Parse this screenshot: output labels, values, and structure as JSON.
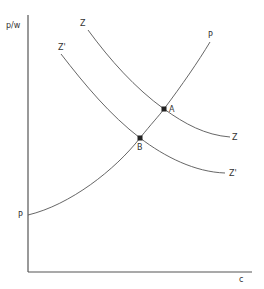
{
  "diagram": {
    "axes": {
      "y_label": "p/w",
      "x_label": "c"
    },
    "curves": [
      {
        "id": "P",
        "label": "P",
        "label_start": "P",
        "description": "upward-sloping curve from y-axis through B and A"
      },
      {
        "id": "Z",
        "label": "Z",
        "label_end": "Z",
        "description": "downward-sloping curve through A"
      },
      {
        "id": "Zprime",
        "label": "Z'",
        "label_end": "Z'",
        "description": "downward-sloping curve through B, below Z"
      }
    ],
    "points": [
      {
        "id": "A",
        "label": "A"
      },
      {
        "id": "B",
        "label": "B"
      }
    ],
    "colors": {
      "line": "#555555",
      "point": "#222222",
      "background": "#ffffff"
    }
  }
}
